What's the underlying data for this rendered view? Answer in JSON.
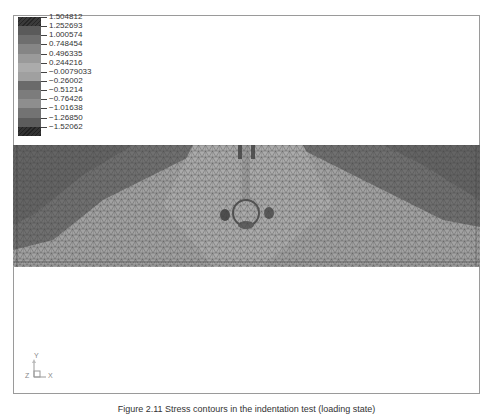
{
  "figure": {
    "caption": "Figure 2.11 Stress contours in the indentation test (loading state)",
    "legend": {
      "entries": [
        {
          "value": "1.504812",
          "color": "#3a3a3a",
          "hatched": true
        },
        {
          "value": "1.252693",
          "color": "#5a5a5a",
          "hatched": false
        },
        {
          "value": "1.000574",
          "color": "#6e6e6e",
          "hatched": false
        },
        {
          "value": "0.748454",
          "color": "#858585",
          "hatched": false
        },
        {
          "value": "0.496335",
          "color": "#9a9a9a",
          "hatched": false
        },
        {
          "value": "0.244216",
          "color": "#ababab",
          "hatched": false
        },
        {
          "value": "−0.0079033",
          "color": "#a0a0a0",
          "hatched": false
        },
        {
          "value": "−0.26002",
          "color": "#6a6a6a",
          "hatched": false
        },
        {
          "value": "−0.51214",
          "color": "#7c7c7c",
          "hatched": false
        },
        {
          "value": "−0.76426",
          "color": "#8e8e8e",
          "hatched": false
        },
        {
          "value": "−1.01638",
          "color": "#737373",
          "hatched": false
        },
        {
          "value": "−1.26850",
          "color": "#5c5c5c",
          "hatched": false
        },
        {
          "value": "−1.52062",
          "color": "#333333",
          "hatched": true
        }
      ]
    },
    "axes_triad": {
      "x_label": "X",
      "y_label": "Y",
      "z_label": "Z"
    },
    "mesh": {
      "description": "Triangular FE mesh with stress contour shading; high-stress region under central indenter",
      "colors": {
        "dark": "#6f6f6f",
        "mid": "#8a8a8a",
        "light": "#a4a4a4",
        "line": "#3c3c3c"
      }
    }
  }
}
